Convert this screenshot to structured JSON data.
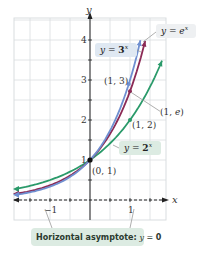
{
  "chart_data": {
    "type": "line",
    "title": "",
    "xlabel": "x",
    "ylabel": "y",
    "xlim": [
      -1.9,
      1.9
    ],
    "ylim": [
      -0.5,
      4.5
    ],
    "grid": true,
    "x_ticks": [
      -1,
      1
    ],
    "x_tick_labels": [
      "−1",
      "1"
    ],
    "y_ticks": [
      1,
      2,
      3,
      4
    ],
    "y_tick_labels": [
      "1",
      "2",
      "3",
      "4"
    ],
    "series": [
      {
        "name": "y = 3^x",
        "label_main": "y = ",
        "label_base": "3",
        "label_exp": "x",
        "color": "#6f8fd0",
        "base": 3
      },
      {
        "name": "y = e^x",
        "label_main": "y = ",
        "label_base": "e",
        "label_exp": "x",
        "color": "#8b2a55",
        "base": 2.718281828
      },
      {
        "name": "y = 2^x",
        "label_main": "y = ",
        "label_base": "2",
        "label_exp": "x",
        "color": "#2a9a6a",
        "base": 2
      }
    ],
    "points": [
      {
        "label": "(0, 1)",
        "x": 0,
        "y": 1
      },
      {
        "label": "(1, 2)",
        "x": 1,
        "y": 2
      },
      {
        "label": "(1, e)",
        "x": 1,
        "y": 2.718
      },
      {
        "label": "(1, 3)",
        "x": 1,
        "y": 3
      }
    ],
    "annotations": [
      {
        "text": "Horizontal asymptote: y = 0",
        "prefix": "Horizontal asymptote: ",
        "var": "y",
        "eq": " = ",
        "value": "0"
      }
    ]
  },
  "colors": {
    "grid": "#d9dde0",
    "axis": "#222222",
    "label_box_blue": "#dfe8f2",
    "label_box_green": "#dcebe2",
    "leader": "#9a9a9a"
  }
}
